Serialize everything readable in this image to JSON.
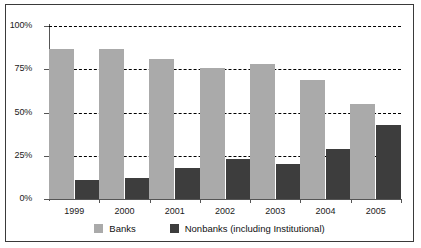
{
  "chart_data": {
    "type": "bar",
    "title": "",
    "subtitle": "",
    "xlabel": "",
    "ylabel": "",
    "categories": [
      "1999",
      "2000",
      "2001",
      "2002",
      "2003",
      "2004",
      "2005"
    ],
    "series": [
      {
        "name": "Banks",
        "color": "#aaaaaa",
        "values": [
          87,
          87,
          81,
          76,
          78,
          69,
          55
        ]
      },
      {
        "name": "Nonbanks (including Institutional)",
        "color": "#3d3d3d",
        "values": [
          11,
          12,
          18,
          23,
          20,
          29,
          43
        ]
      }
    ],
    "ylim": [
      0,
      100
    ],
    "yticks": [
      0,
      25,
      50,
      75,
      100
    ],
    "ytick_labels": [
      "0%",
      "25%",
      "50%",
      "75%",
      "100%"
    ],
    "grid": true,
    "grid_style": "dashed-horizontal",
    "legend_position": "bottom",
    "legend_entries": [
      "Banks",
      "Nonbanks (including Institutional)"
    ]
  },
  "axis": {
    "y_labels": [
      "100%",
      "75%",
      "50%",
      "25%",
      "0%"
    ],
    "x_labels": [
      "1999",
      "2000",
      "2001",
      "2002",
      "2003",
      "2004",
      "2005"
    ]
  },
  "legend": {
    "items": [
      {
        "label": "Banks"
      },
      {
        "label": "Nonbanks (including Institutional)"
      }
    ]
  }
}
